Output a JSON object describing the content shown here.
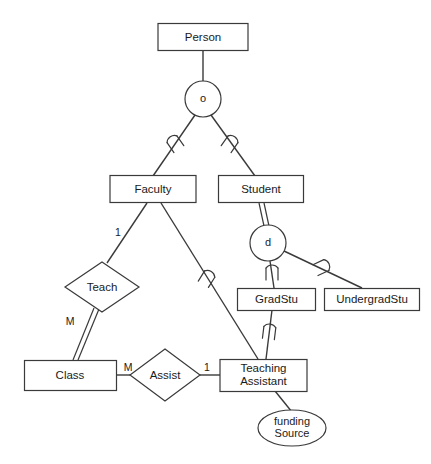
{
  "diagram": {
    "type": "entity-relationship-diagram",
    "colors": {
      "stroke": "#3a3a3a",
      "text": "#1a1a1a",
      "background": "#ffffff"
    },
    "entities": [
      {
        "id": "person",
        "label": "Person",
        "x": 203,
        "y": 37,
        "w": 90,
        "h": 27
      },
      {
        "id": "faculty",
        "label": "Faculty",
        "x": 153,
        "y": 189,
        "w": 86,
        "h": 27
      },
      {
        "id": "student",
        "label": "Student",
        "x": 261,
        "y": 189,
        "w": 85,
        "h": 27
      },
      {
        "id": "gradstu",
        "label": "GradStu",
        "x": 276,
        "y": 299,
        "w": 78,
        "h": 22
      },
      {
        "id": "undergradstu",
        "label": "UndergradStu",
        "x": 372,
        "y": 299,
        "w": 95,
        "h": 22
      },
      {
        "id": "class",
        "label": "Class",
        "x": 70,
        "y": 375,
        "w": 92,
        "h": 30
      },
      {
        "id": "teaching_assistant",
        "label_line1": "Teaching",
        "label_line2": "Assistant",
        "x": 263,
        "y": 375,
        "w": 87,
        "h": 32
      }
    ],
    "relationships": [
      {
        "id": "teach",
        "label": "Teach",
        "x": 102,
        "y": 287,
        "rx": 37,
        "ry": 25
      },
      {
        "id": "assist",
        "label": "Assist",
        "x": 165,
        "y": 375,
        "rx": 35,
        "ry": 26
      }
    ],
    "attributes": [
      {
        "id": "funding_source",
        "label_line1": "funding",
        "label_line2": "Source",
        "x": 292,
        "y": 428,
        "rx": 34,
        "ry": 18
      }
    ],
    "specialization_circles": [
      {
        "id": "overlapping_person",
        "label": "o",
        "x": 203,
        "y": 99,
        "r": 18,
        "meaning": "overlapping"
      },
      {
        "id": "disjoint_student",
        "label": "d",
        "x": 268,
        "y": 243,
        "r": 18,
        "meaning": "disjoint"
      }
    ],
    "cardinality_labels": [
      {
        "id": "faculty-teach-card",
        "label": "1",
        "x": 118,
        "y": 233
      },
      {
        "id": "class-teach-card",
        "label": "M",
        "x": 70,
        "y": 322
      },
      {
        "id": "class-assist-card",
        "label": "M",
        "x": 128,
        "y": 368
      },
      {
        "id": "assist-ta-card",
        "label": "1",
        "x": 207,
        "y": 368
      }
    ],
    "connections": [
      {
        "id": "person-to-circle",
        "kind": "single"
      },
      {
        "id": "circle-to-faculty",
        "kind": "single",
        "marker": "subset"
      },
      {
        "id": "circle-to-student",
        "kind": "single",
        "marker": "subset"
      },
      {
        "id": "student-to-d-circle",
        "kind": "double"
      },
      {
        "id": "d-circle-to-gradstu",
        "kind": "single",
        "marker": "subset"
      },
      {
        "id": "d-circle-to-undergradstu",
        "kind": "single",
        "marker": "subset"
      },
      {
        "id": "faculty-to-teach",
        "kind": "single"
      },
      {
        "id": "teach-to-class",
        "kind": "double"
      },
      {
        "id": "faculty-to-ta",
        "kind": "single",
        "marker": "subset"
      },
      {
        "id": "gradstu-to-ta",
        "kind": "single",
        "marker": "subset"
      },
      {
        "id": "class-to-assist",
        "kind": "single"
      },
      {
        "id": "assist-to-ta",
        "kind": "single"
      },
      {
        "id": "ta-to-funding-source",
        "kind": "single"
      }
    ]
  }
}
